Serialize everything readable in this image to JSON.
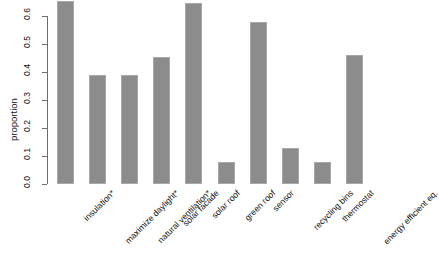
{
  "chart_data": {
    "type": "bar",
    "title": "",
    "xlabel": "",
    "ylabel": "proportion",
    "ylim": [
      0.0,
      0.6
    ],
    "grid": false,
    "legend": null,
    "bar_color": "#8c8c8c",
    "bar_border_color": "#a8a8a8",
    "axis_color": "#6e6e6e",
    "background": "#ffffff",
    "ytick_labels": [
      "0.0",
      "0.1",
      "0.2",
      "0.3",
      "0.4",
      "0.5",
      "0.6"
    ],
    "ytick_values": [
      0.0,
      0.1,
      0.2,
      0.3,
      0.4,
      0.5,
      0.6
    ],
    "categories": [
      "insulation*",
      "maximize daylight*",
      "natural ventilation*",
      "solar facade",
      "solar roof",
      "green roof",
      "sensor",
      "recycling bins",
      "thermostat",
      "energy efficient eq."
    ],
    "values": [
      0.655,
      0.39,
      0.39,
      0.455,
      0.645,
      0.08,
      0.58,
      0.13,
      0.08,
      0.46
    ]
  }
}
